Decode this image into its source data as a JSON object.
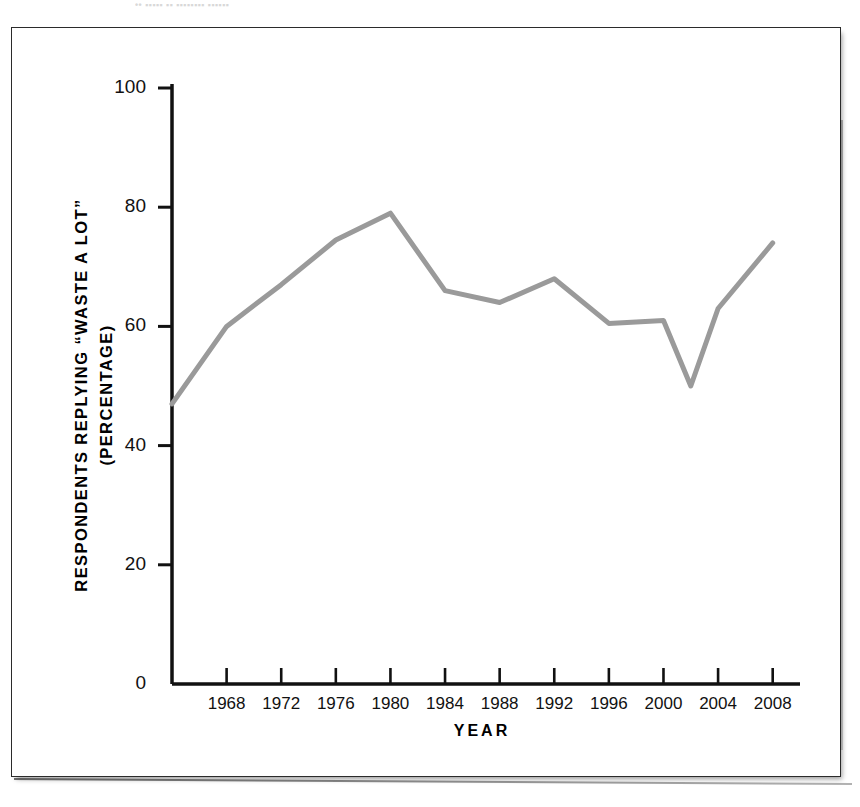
{
  "figure": {
    "top_bleed_text": "•• ▪▪▪▪▪ ▪▪ ▪▪▪▪▪▪▪▪ ▪▪▪▪▪▪",
    "frame_color": "#2b2b2b",
    "background_color": "#ffffff"
  },
  "chart_data": {
    "type": "line",
    "title": "",
    "subtitle": "",
    "xlabel": "YEAR",
    "ylabel": "RESPONDENTS REPLYING “WASTE A LOT” (PERCENTAGE)",
    "ylabel_line1": "RESPONDENTS REPLYING “WASTE A LOT”",
    "ylabel_line2": "(PERCENTAGE)",
    "xlim": [
      1964,
      2010
    ],
    "ylim": [
      0,
      104
    ],
    "grid": false,
    "legend": null,
    "line_color": "#9a9a9a",
    "line_width": 5,
    "y_ticks": [
      0,
      20,
      40,
      60,
      80,
      100
    ],
    "y_tick_labels": [
      "0",
      "20",
      "40",
      "60",
      "80",
      "100"
    ],
    "x_ticks": [
      1968,
      1972,
      1976,
      1980,
      1984,
      1988,
      1992,
      1996,
      2000,
      2004,
      2008
    ],
    "x_tick_labels": [
      "1968",
      "1972",
      "1976",
      "1980",
      "1984",
      "1988",
      "1992",
      "1996",
      "2000",
      "2004",
      "2008"
    ],
    "x": [
      1964,
      1968,
      1972,
      1976,
      1980,
      1984,
      1988,
      1992,
      1996,
      2000,
      2002,
      2004,
      2008
    ],
    "values": [
      47,
      60,
      67,
      74.5,
      79,
      66,
      64,
      68,
      60.5,
      61,
      50,
      63,
      74
    ],
    "series": [
      {
        "name": "Waste a lot",
        "color": "#9a9a9a",
        "points": [
          {
            "x": 1964,
            "y": 47
          },
          {
            "x": 1968,
            "y": 60
          },
          {
            "x": 1972,
            "y": 67
          },
          {
            "x": 1976,
            "y": 74.5
          },
          {
            "x": 1980,
            "y": 79
          },
          {
            "x": 1984,
            "y": 66
          },
          {
            "x": 1988,
            "y": 64
          },
          {
            "x": 1992,
            "y": 68
          },
          {
            "x": 1996,
            "y": 60.5
          },
          {
            "x": 2000,
            "y": 61
          },
          {
            "x": 2002,
            "y": 50
          },
          {
            "x": 2004,
            "y": 63
          },
          {
            "x": 2008,
            "y": 74
          }
        ]
      }
    ]
  }
}
